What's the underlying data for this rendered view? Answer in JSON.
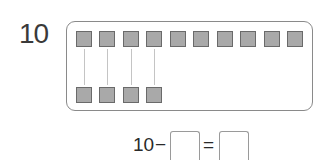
{
  "problem": {
    "number": "10",
    "top_row_count": 10,
    "bottom_row_count": 4,
    "equation": {
      "left_operand": "10",
      "operator": "−",
      "equals": "=",
      "blank1": "",
      "blank2": ""
    }
  },
  "colors": {
    "square_fill": "#a9a9a9",
    "square_border": "#6a6a6a",
    "frame_border": "#8a8a8a",
    "connector": "#c4c4c4"
  }
}
